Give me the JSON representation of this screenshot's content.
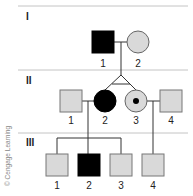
{
  "diagram": {
    "type": "pedigree",
    "colors": {
      "affected": "#000000",
      "unaffected": "#d9d9d9",
      "outline": "#555555",
      "divider": "#bdbdbd",
      "line": "#333333"
    },
    "generations": [
      {
        "label": "I",
        "individuals": [
          {
            "number": "1",
            "sex": "male",
            "status": "affected"
          },
          {
            "number": "2",
            "sex": "female",
            "status": "unaffected"
          }
        ]
      },
      {
        "label": "II",
        "individuals": [
          {
            "number": "1",
            "sex": "male",
            "status": "unaffected"
          },
          {
            "number": "2",
            "sex": "female",
            "status": "affected",
            "twin": "identical with II-3"
          },
          {
            "number": "3",
            "sex": "female",
            "status": "carrier",
            "twin": "identical with II-2"
          },
          {
            "number": "4",
            "sex": "male",
            "status": "unaffected"
          }
        ]
      },
      {
        "label": "III",
        "individuals": [
          {
            "number": "1",
            "sex": "male",
            "status": "unaffected",
            "parents": "II-1 x II-2"
          },
          {
            "number": "2",
            "sex": "male",
            "status": "affected",
            "parents": "II-1 x II-2"
          },
          {
            "number": "3",
            "sex": "male",
            "status": "unaffected",
            "parents": "II-1 x II-2"
          },
          {
            "number": "4",
            "sex": "male",
            "status": "unaffected",
            "parents": "II-3 x II-4"
          }
        ]
      }
    ],
    "credit": "© Cengage Learning"
  }
}
